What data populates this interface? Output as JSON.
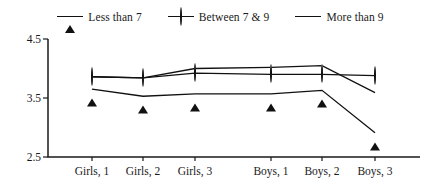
{
  "chart_data": {
    "type": "line",
    "title": "",
    "subtitle": "",
    "xlabel": "",
    "ylabel": "",
    "categories": [
      "Girls, 1",
      "Girls, 2",
      "Girls, 3",
      "Boys, 1",
      "Boys, 2",
      "Boys, 3"
    ],
    "ylim": [
      2.5,
      4.5
    ],
    "yticks": [
      2.5,
      3.5,
      4.5
    ],
    "ytick_labels": [
      "2.5",
      "3.5",
      "4.5"
    ],
    "grid": false,
    "legend_position": "top-center",
    "series": [
      {
        "name": "Less than 7",
        "marker": "filled-triangle",
        "values": [
          3.65,
          3.53,
          3.57,
          3.57,
          3.63,
          2.91
        ]
      },
      {
        "name": "Between 7 & 9",
        "marker": "open-circle",
        "values": [
          3.86,
          3.84,
          3.92,
          3.9,
          3.9,
          3.88
        ]
      },
      {
        "name": "More than 9",
        "marker": "filled-square",
        "values": [
          3.86,
          3.84,
          4.0,
          4.02,
          4.05,
          3.59
        ]
      }
    ]
  },
  "legend": {
    "entries": [
      {
        "label": "Less than 7",
        "marker": "filled-triangle"
      },
      {
        "label": "Between 7 & 9",
        "marker": "open-circle"
      },
      {
        "label": "More than 9",
        "marker": "filled-square"
      }
    ]
  },
  "axes": {
    "y_tick_labels": [
      "4.5",
      "3.5",
      "2.5"
    ],
    "x_tick_labels": [
      "Girls, 1",
      "Girls, 2",
      "Girls, 3",
      "Boys, 1",
      "Boys, 2",
      "Boys, 3"
    ]
  },
  "colors": {
    "ink": "#111111",
    "background": "#ffffff"
  }
}
